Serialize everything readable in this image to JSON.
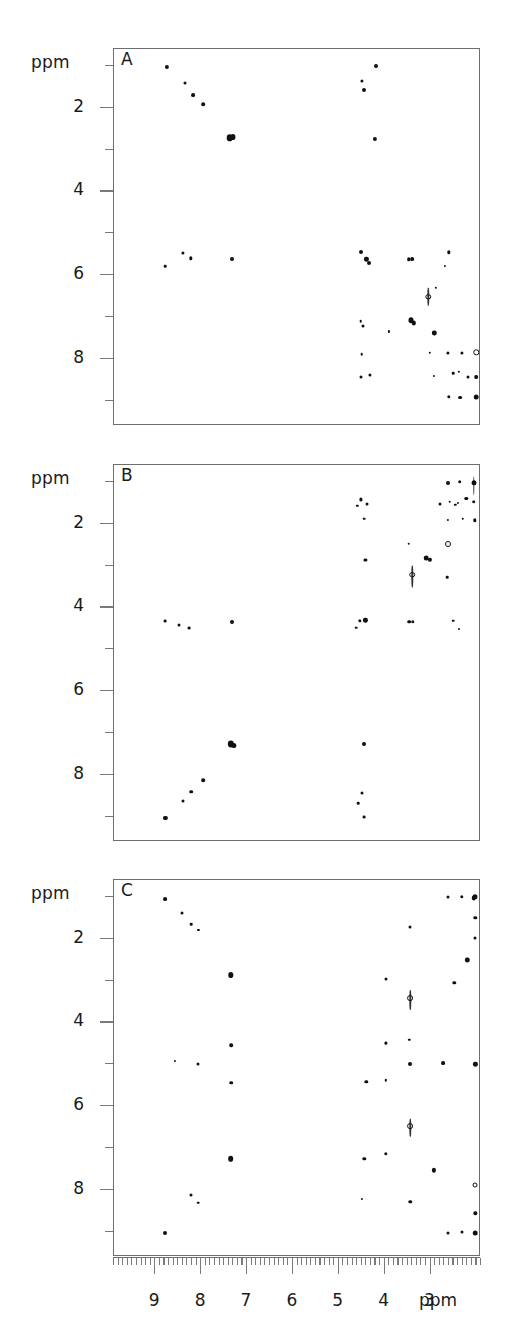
{
  "figure": {
    "type": "nmr-2d-spectra-stack",
    "panel_count": 3,
    "axis_unit": "ppm"
  },
  "axes": {
    "y_unit_label": "ppm",
    "y_tick_labels": [
      "2",
      "4",
      "6",
      "8"
    ],
    "y_major_values": [
      2,
      4,
      6,
      8
    ],
    "y_minor_values": [
      1,
      3,
      5,
      7,
      9
    ],
    "y_range": [
      0.6,
      9.6
    ],
    "x_unit_label": "ppm",
    "x_tick_labels": [
      "9",
      "8",
      "7",
      "6",
      "5",
      "4",
      "3"
    ],
    "x_major_values": [
      9,
      8,
      7,
      6,
      5,
      4,
      3
    ],
    "x_minor_step": 0.1,
    "x_range": [
      9.9,
      1.9
    ],
    "x_direction": "decreasing"
  },
  "panels": [
    {
      "id": "A",
      "label": "A"
    },
    {
      "id": "B",
      "label": "B"
    },
    {
      "id": "C",
      "label": "C"
    }
  ],
  "chart_data": {
    "type": "scatter",
    "title": "",
    "xlabel": "ppm",
    "ylabel": "ppm",
    "xlim": [
      9.9,
      1.9
    ],
    "ylim": [
      0.6,
      9.6
    ],
    "grid": false,
    "legend": null,
    "note": "Three 2D homonuclear NMR contour spectra; peaks given as [x_ppm, y_ppm, diameter_px, style].",
    "series": [
      {
        "name": "A",
        "peaks": [
          [
            8.75,
            1.02,
            4.2,
            "dot"
          ],
          [
            8.35,
            1.42,
            3.0,
            "dot"
          ],
          [
            8.18,
            1.7,
            3.8,
            "dot"
          ],
          [
            7.95,
            1.92,
            3.6,
            "dot"
          ],
          [
            7.38,
            2.72,
            6.6,
            "blob"
          ],
          [
            7.3,
            2.7,
            5.2,
            "blob"
          ],
          [
            4.18,
            1.0,
            4.0,
            "dot"
          ],
          [
            4.5,
            1.36,
            3.2,
            "dot"
          ],
          [
            4.45,
            1.58,
            4.0,
            "dot"
          ],
          [
            4.22,
            2.75,
            4.2,
            "dot"
          ],
          [
            8.78,
            5.78,
            2.6,
            "dot"
          ],
          [
            8.4,
            5.47,
            3.2,
            "dot"
          ],
          [
            8.22,
            5.6,
            3.4,
            "dot"
          ],
          [
            7.32,
            5.62,
            4.0,
            "dot"
          ],
          [
            4.52,
            5.45,
            4.0,
            "dot"
          ],
          [
            4.4,
            5.62,
            4.2,
            "blob"
          ],
          [
            4.35,
            5.7,
            4.0,
            "dot"
          ],
          [
            3.48,
            5.62,
            3.6,
            "dot"
          ],
          [
            3.4,
            5.62,
            3.8,
            "dot"
          ],
          [
            2.6,
            5.45,
            3.4,
            "dot"
          ],
          [
            2.68,
            5.78,
            2.2,
            "dot"
          ],
          [
            3.05,
            6.52,
            3.4,
            "ring"
          ],
          [
            3.05,
            6.52,
            4.0,
            "streak-v"
          ],
          [
            2.88,
            6.3,
            2.4,
            "dot"
          ],
          [
            4.52,
            7.1,
            2.6,
            "dot"
          ],
          [
            4.48,
            7.22,
            3.0,
            "dot"
          ],
          [
            3.42,
            7.08,
            5.0,
            "blob"
          ],
          [
            3.36,
            7.14,
            4.4,
            "blob"
          ],
          [
            3.9,
            7.34,
            2.2,
            "dot"
          ],
          [
            2.92,
            7.38,
            4.4,
            "blob"
          ],
          [
            4.5,
            7.88,
            2.6,
            "dot"
          ],
          [
            3.02,
            7.85,
            2.4,
            "dot"
          ],
          [
            2.32,
            7.86,
            3.2,
            "dot"
          ],
          [
            2.62,
            7.86,
            3.2,
            "dot"
          ],
          [
            2.0,
            7.84,
            3.4,
            "ring"
          ],
          [
            4.52,
            8.42,
            3.0,
            "dot"
          ],
          [
            4.32,
            8.38,
            3.2,
            "dot"
          ],
          [
            2.92,
            8.4,
            2.2,
            "dot"
          ],
          [
            2.5,
            8.34,
            2.6,
            "dot"
          ],
          [
            2.38,
            8.3,
            2.4,
            "dot"
          ],
          [
            2.18,
            8.44,
            3.0,
            "dot"
          ],
          [
            2.0,
            8.42,
            3.6,
            "blob"
          ],
          [
            2.35,
            8.92,
            3.8,
            "dot"
          ],
          [
            2.0,
            8.9,
            4.6,
            "blob"
          ],
          [
            2.6,
            8.9,
            3.4,
            "dot"
          ]
        ]
      },
      {
        "name": "B",
        "peaks": [
          [
            2.62,
            1.02,
            4.0,
            "dot"
          ],
          [
            2.36,
            1.0,
            3.6,
            "dot"
          ],
          [
            2.06,
            1.02,
            5.0,
            "blob"
          ],
          [
            2.06,
            1.1,
            4.2,
            "streak-v"
          ],
          [
            4.52,
            1.42,
            3.2,
            "dot"
          ],
          [
            4.6,
            1.58,
            2.4,
            "dot"
          ],
          [
            4.38,
            1.52,
            3.0,
            "dot"
          ],
          [
            2.8,
            1.52,
            3.0,
            "dot"
          ],
          [
            2.58,
            1.48,
            2.6,
            "dot"
          ],
          [
            2.46,
            1.55,
            2.4,
            "dot"
          ],
          [
            2.4,
            1.5,
            2.2,
            "dot"
          ],
          [
            2.22,
            1.4,
            3.4,
            "blob"
          ],
          [
            2.06,
            1.48,
            3.6,
            "dot"
          ],
          [
            4.44,
            1.88,
            2.6,
            "dot"
          ],
          [
            2.62,
            1.92,
            2.2,
            "dot"
          ],
          [
            2.3,
            1.88,
            2.4,
            "dot"
          ],
          [
            2.04,
            1.92,
            3.4,
            "dot"
          ],
          [
            3.48,
            2.48,
            2.6,
            "dot"
          ],
          [
            2.62,
            2.48,
            4.0,
            "ring"
          ],
          [
            4.42,
            2.86,
            3.2,
            "dot"
          ],
          [
            3.1,
            2.82,
            4.6,
            "blob"
          ],
          [
            3.02,
            2.86,
            4.2,
            "blob"
          ],
          [
            3.4,
            3.22,
            3.6,
            "ring"
          ],
          [
            3.4,
            3.26,
            4.6,
            "streak-v"
          ],
          [
            2.64,
            3.28,
            2.6,
            "dot"
          ],
          [
            8.78,
            4.32,
            2.8,
            "dot"
          ],
          [
            8.26,
            4.5,
            2.8,
            "dot"
          ],
          [
            8.48,
            4.42,
            3.0,
            "dot"
          ],
          [
            7.32,
            4.35,
            4.0,
            "dot"
          ],
          [
            4.54,
            4.32,
            3.4,
            "dot"
          ],
          [
            4.42,
            4.3,
            4.2,
            "blob"
          ],
          [
            4.62,
            4.48,
            2.6,
            "dot"
          ],
          [
            3.46,
            4.34,
            3.6,
            "dot"
          ],
          [
            3.38,
            4.34,
            3.4,
            "dot"
          ],
          [
            2.5,
            4.32,
            2.6,
            "dot"
          ],
          [
            2.38,
            4.52,
            2.0,
            "dot"
          ],
          [
            7.36,
            7.26,
            6.4,
            "blob"
          ],
          [
            7.28,
            7.3,
            5.2,
            "blob"
          ],
          [
            4.46,
            7.26,
            4.0,
            "dot"
          ],
          [
            7.95,
            8.12,
            3.6,
            "dot"
          ],
          [
            8.22,
            8.4,
            3.6,
            "dot"
          ],
          [
            8.4,
            8.62,
            3.0,
            "dot"
          ],
          [
            4.5,
            8.42,
            3.0,
            "dot"
          ],
          [
            4.58,
            8.68,
            2.6,
            "dot"
          ],
          [
            8.78,
            9.02,
            4.2,
            "dot"
          ],
          [
            4.44,
            9.0,
            2.8,
            "dot"
          ]
        ]
      },
      {
        "name": "C",
        "peaks": [
          [
            2.32,
            1.0,
            3.4,
            "dot"
          ],
          [
            2.62,
            1.0,
            3.0,
            "dot"
          ],
          [
            2.02,
            1.0,
            5.0,
            "blob"
          ],
          [
            2.06,
            1.04,
            4.4,
            "blob"
          ],
          [
            8.78,
            1.06,
            3.8,
            "dot"
          ],
          [
            8.42,
            1.38,
            3.0,
            "dot"
          ],
          [
            8.22,
            1.66,
            2.6,
            "dot"
          ],
          [
            8.06,
            1.8,
            2.2,
            "dot"
          ],
          [
            2.02,
            1.5,
            3.4,
            "dot"
          ],
          [
            2.02,
            1.98,
            3.0,
            "dot"
          ],
          [
            3.44,
            1.72,
            3.0,
            "dot"
          ],
          [
            2.2,
            2.52,
            4.4,
            "blob"
          ],
          [
            7.36,
            2.86,
            5.4,
            "blob"
          ],
          [
            2.48,
            3.06,
            3.4,
            "dot"
          ],
          [
            3.98,
            2.96,
            3.0,
            "dot"
          ],
          [
            3.44,
            3.42,
            3.8,
            "ring"
          ],
          [
            3.44,
            3.46,
            4.4,
            "streak-v"
          ],
          [
            7.34,
            4.54,
            3.6,
            "dot"
          ],
          [
            3.98,
            4.48,
            3.0,
            "dot"
          ],
          [
            3.98,
            4.5,
            2.6,
            "dot"
          ],
          [
            3.46,
            4.42,
            2.4,
            "dot"
          ],
          [
            8.58,
            4.92,
            2.2,
            "dot"
          ],
          [
            8.06,
            5.0,
            3.0,
            "dot"
          ],
          [
            3.44,
            5.0,
            4.0,
            "dot"
          ],
          [
            2.72,
            4.98,
            3.8,
            "dot"
          ],
          [
            2.02,
            5.0,
            4.2,
            "blob"
          ],
          [
            7.34,
            5.44,
            3.6,
            "dot"
          ],
          [
            4.4,
            5.42,
            3.4,
            "dot"
          ],
          [
            3.98,
            5.38,
            2.4,
            "dot"
          ],
          [
            3.44,
            6.48,
            3.8,
            "ring"
          ],
          [
            3.44,
            6.52,
            4.0,
            "streak-v"
          ],
          [
            7.36,
            7.26,
            5.6,
            "blob"
          ],
          [
            4.44,
            7.26,
            3.4,
            "dot"
          ],
          [
            3.98,
            7.14,
            3.4,
            "dot"
          ],
          [
            2.92,
            7.52,
            4.2,
            "blob"
          ],
          [
            2.02,
            7.88,
            3.0,
            "ring"
          ],
          [
            8.22,
            8.12,
            3.0,
            "dot"
          ],
          [
            8.06,
            8.3,
            2.6,
            "dot"
          ],
          [
            3.44,
            8.28,
            3.4,
            "dot"
          ],
          [
            4.5,
            8.22,
            2.2,
            "dot"
          ],
          [
            2.02,
            8.56,
            3.4,
            "dot"
          ],
          [
            8.78,
            9.02,
            4.0,
            "dot"
          ],
          [
            2.62,
            9.02,
            3.0,
            "dot"
          ],
          [
            2.32,
            9.0,
            3.0,
            "dot"
          ],
          [
            2.02,
            9.02,
            4.6,
            "blob"
          ]
        ]
      }
    ]
  }
}
